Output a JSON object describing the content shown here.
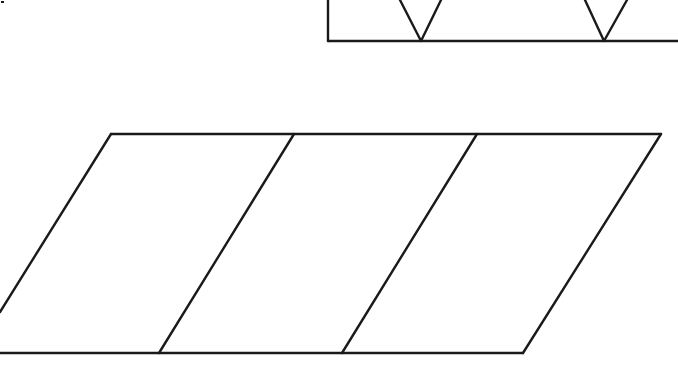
{
  "canvas": {
    "width": 678,
    "height": 368,
    "background": "#ffffff",
    "stroke_color": "#1a1a1a"
  },
  "top_partial_shape": {
    "description": "Partial rectangle band with two V-shaped notches, clipped at top and right edges",
    "left_edge": {
      "x": 328,
      "y1": 0,
      "y2": 41
    },
    "bottom_edge": {
      "y": 41,
      "x1": 328,
      "x2": 678
    },
    "v_notches": [
      {
        "left_top": [
          400,
          0
        ],
        "tip": [
          421,
          41
        ],
        "right_top": [
          441,
          0
        ]
      },
      {
        "left_top": [
          585,
          0
        ],
        "tip": [
          604,
          41
        ],
        "right_top": [
          627,
          0
        ]
      }
    ]
  },
  "main_parallelogram": {
    "description": "Slanted parallelogram divided into three equal slanted sections; left side clipped by frame",
    "top_edge": {
      "y": 134,
      "x1": 111,
      "x2": 661
    },
    "bottom_edge": {
      "y": 353,
      "x1": 0,
      "x2": 523
    },
    "left_edge": {
      "from": [
        111,
        134
      ],
      "to": [
        0,
        312
      ]
    },
    "right_edge": {
      "from": [
        661,
        134
      ],
      "to": [
        523,
        353
      ]
    },
    "dividers": [
      {
        "from": [
          294,
          134
        ],
        "to": [
          159,
          353
        ]
      },
      {
        "from": [
          477,
          134
        ],
        "to": [
          342,
          353
        ]
      }
    ],
    "section_count": 3
  },
  "stray_mark": {
    "x": 1,
    "y": 1,
    "size": 3
  }
}
